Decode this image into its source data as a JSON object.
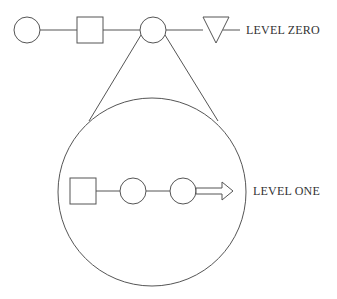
{
  "diagram": {
    "level_zero": {
      "label": "LEVEL ZERO",
      "nodes": [
        "circle",
        "square",
        "circle (expanded)",
        "triangle"
      ]
    },
    "level_one": {
      "label": "LEVEL ONE",
      "nodes": [
        "square",
        "circle",
        "circle",
        "arrow"
      ]
    },
    "colors": {
      "stroke": "#555555",
      "background": "#ffffff",
      "text": "#333333"
    }
  }
}
